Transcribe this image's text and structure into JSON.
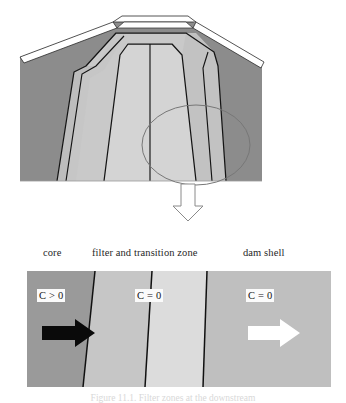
{
  "figure": {
    "caption": "Figure 11.1. Filter zones at the downstream"
  },
  "cross_section": {
    "title": "dam cross-section with internal zones",
    "colors": {
      "shell_dark": "#8c8c8c",
      "zone_mid": "#bdbdbd",
      "zone_light": "#cdcdcd",
      "zone_core": "#c4c4c4",
      "outline": "#151515",
      "crest_white": "#ffffff",
      "ellipse_line": "#6e6e6e"
    },
    "ellipse_label": "detail-region-highlight",
    "callout_arrow": "down-arrow-callout"
  },
  "zone_labels": {
    "core": "core",
    "filter": "filter and transition zone",
    "shell": "dam shell"
  },
  "detail_panel": {
    "zones": [
      {
        "name": "core",
        "tag": "C > 0",
        "fill": "#999999"
      },
      {
        "name": "filter",
        "tag": "C = 0",
        "fill": "#c6c6c6"
      },
      {
        "name": "transition",
        "tag": "",
        "fill": "#dcdcdc"
      },
      {
        "name": "shell",
        "tag": "C = 0",
        "fill": "#bfbfbf"
      }
    ],
    "tags": {
      "core": "C > 0",
      "filter": "C = 0",
      "shell": "C = 0"
    },
    "arrows": {
      "left": "black-flow-arrow",
      "right": "white-flow-arrow"
    },
    "colors": {
      "boundary": "#101010",
      "arrow_black": "#0a0a0a",
      "arrow_white": "#ffffff"
    }
  }
}
